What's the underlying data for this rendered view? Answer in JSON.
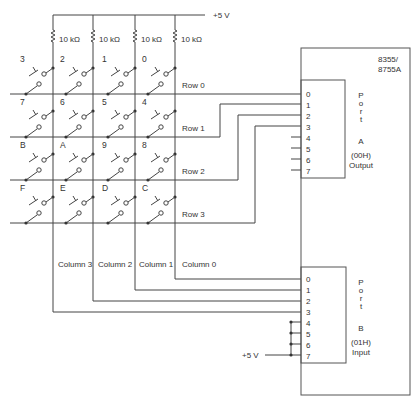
{
  "supply": {
    "top_label": "+5 V",
    "bottom_label": "+5 V"
  },
  "resistors": [
    {
      "label": "10 kΩ"
    },
    {
      "label": "10 kΩ"
    },
    {
      "label": "10 kΩ"
    },
    {
      "label": "10 kΩ"
    }
  ],
  "keys": [
    [
      "3",
      "2",
      "1",
      "0"
    ],
    [
      "7",
      "6",
      "5",
      "4"
    ],
    [
      "B",
      "A",
      "9",
      "8"
    ],
    [
      "F",
      "E",
      "D",
      "C"
    ]
  ],
  "rows": [
    {
      "label": "Row 0"
    },
    {
      "label": "Row 1"
    },
    {
      "label": "Row 2"
    },
    {
      "label": "Row 3"
    }
  ],
  "columns": [
    {
      "label": "Column 3"
    },
    {
      "label": "Column 2"
    },
    {
      "label": "Column 1"
    },
    {
      "label": "Column 0"
    }
  ],
  "chip": {
    "name_line1": "8355/",
    "name_line2": "8755A",
    "port_a": {
      "pins": [
        "0",
        "1",
        "2",
        "3",
        "4",
        "5",
        "6",
        "7"
      ],
      "word_letters": [
        "P",
        "o",
        "r",
        "t"
      ],
      "letter": "A",
      "address": "(00H)",
      "direction": "Output"
    },
    "port_b": {
      "pins": [
        "0",
        "1",
        "2",
        "3",
        "4",
        "5",
        "6",
        "7"
      ],
      "word_letters": [
        "P",
        "o",
        "r",
        "t"
      ],
      "letter": "B",
      "address": "(01H)",
      "direction": "Input"
    }
  }
}
